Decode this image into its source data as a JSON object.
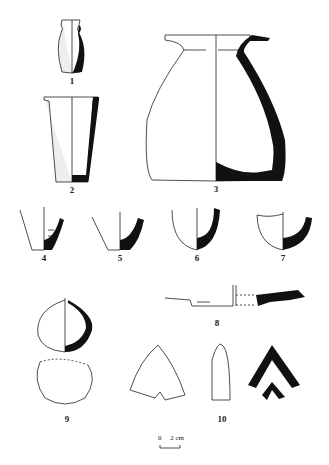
{
  "figure": {
    "colors": {
      "ink": "#111111",
      "section_fill": "#111111",
      "background": "#ffffff"
    },
    "labels": [
      "1",
      "2",
      "3",
      "4",
      "5",
      "6",
      "7",
      "8",
      "9",
      "10"
    ],
    "scale_bar": {
      "zero": "0",
      "value": "2 cm"
    }
  }
}
